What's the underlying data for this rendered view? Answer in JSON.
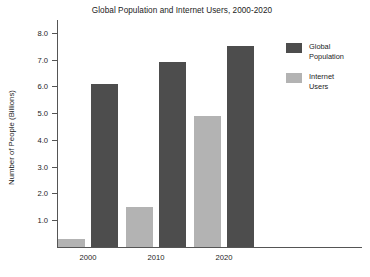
{
  "chart_data": {
    "type": "bar",
    "title": "Global Population and Internet Users, 2000-2020",
    "xlabel": "",
    "ylabel": "Number of People (Billions)",
    "categories": [
      "2000",
      "2010",
      "2020"
    ],
    "series": [
      {
        "name": "Internet Users",
        "values": [
          0.3,
          1.5,
          4.9
        ],
        "color": "#b3b3b3"
      },
      {
        "name": "Global Population",
        "values": [
          6.1,
          6.9,
          7.5
        ],
        "color": "#4d4d4d"
      }
    ],
    "ylim": [
      0,
      8.4
    ],
    "yticks": [
      "1.0",
      "2.0",
      "3.0",
      "4.0",
      "5.0",
      "6.0",
      "7.0",
      "8.0"
    ],
    "ytick_values": [
      1.0,
      2.0,
      3.0,
      4.0,
      5.0,
      6.0,
      7.0,
      8.0
    ],
    "grid": false,
    "legend_position": "right",
    "legend": [
      {
        "label": "Global\nPopulation",
        "color": "#4d4d4d"
      },
      {
        "label": "Internet\nUsers",
        "color": "#b3b3b3"
      }
    ]
  }
}
